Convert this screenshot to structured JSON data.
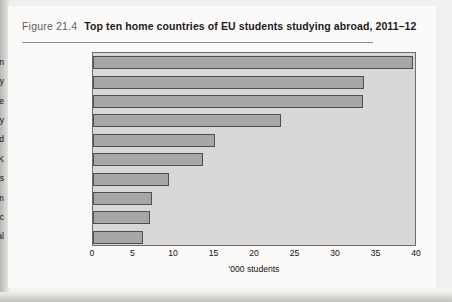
{
  "figure": {
    "number": "Figure 21.4",
    "title": "Top ten home countries of EU students studying abroad, 2011–12"
  },
  "chart_data": {
    "type": "bar",
    "orientation": "horizontal",
    "title": "Top ten home countries of EU students studying abroad, 2011–12",
    "categories": [
      "Spain",
      "Germany",
      "France",
      "Italy",
      "Poland",
      "UK",
      "Netherlands",
      "Belgium",
      "Czech Republic",
      "Portugal"
    ],
    "values": [
      39.5,
      33.5,
      33.3,
      23.2,
      15.0,
      13.6,
      9.4,
      7.3,
      7.0,
      6.2
    ],
    "xlabel": "'000 students",
    "ylabel": "",
    "xlim": [
      0,
      40
    ],
    "xticks": [
      0,
      5,
      10,
      15,
      20,
      25,
      30,
      35,
      40
    ],
    "xtick_labels": [
      "0",
      "5",
      "10",
      "15",
      "20",
      "25",
      "30",
      "35",
      "40"
    ],
    "grid": false,
    "legend": null,
    "series": [
      {
        "name": "'000 students",
        "values": [
          39.5,
          33.5,
          33.3,
          23.2,
          15.0,
          13.6,
          9.4,
          7.3,
          7.0,
          6.2
        ]
      }
    ],
    "colors": {
      "bar_fill": "#a7a6a4",
      "bar_edge": "#4f4f4f",
      "plot_background": "#d9d8d6"
    }
  }
}
